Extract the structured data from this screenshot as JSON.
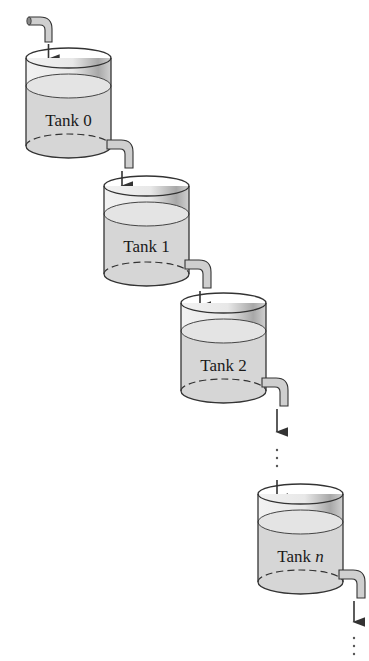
{
  "diagram": {
    "colors": {
      "water": "#d9d9d9",
      "water_surface": "#e6e6e6",
      "outline": "#333333",
      "pipe_fill": "#cfcfcf",
      "arrow": "#333333",
      "background": "#ffffff"
    },
    "tanks": [
      {
        "name": "Tank",
        "index": "0",
        "label": "Tank 0"
      },
      {
        "name": "Tank",
        "index": "1",
        "label": "Tank 1"
      },
      {
        "name": "Tank",
        "index": "2",
        "label": "Tank 2"
      },
      {
        "name": "Tank",
        "index": "n",
        "label": "Tank n"
      }
    ],
    "ellipsis": "⋮"
  }
}
